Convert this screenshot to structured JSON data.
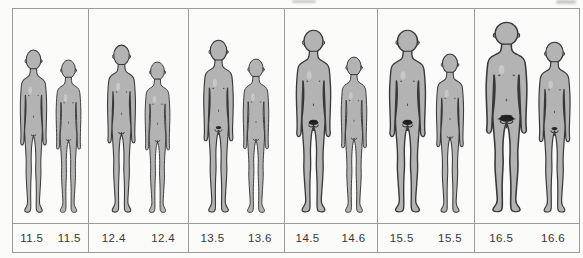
{
  "panels": [
    {
      "ages": [
        "11.5",
        "11.5"
      ],
      "figures": [
        {
          "h": 166,
          "w": 33,
          "pubic": 0
        },
        {
          "h": 156,
          "w": 31,
          "pubic": 0
        }
      ]
    },
    {
      "ages": [
        "12.4",
        "12.4"
      ],
      "figures": [
        {
          "h": 171,
          "w": 35,
          "pubic": 1
        },
        {
          "h": 154,
          "w": 31,
          "pubic": 0
        }
      ]
    },
    {
      "ages": [
        "13.5",
        "13.6"
      ],
      "figures": [
        {
          "h": 176,
          "w": 37,
          "pubic": 2
        },
        {
          "h": 157,
          "w": 32,
          "pubic": 1
        }
      ]
    },
    {
      "ages": [
        "14.5",
        "14.6"
      ],
      "figures": [
        {
          "h": 186,
          "w": 43,
          "pubic": 3
        },
        {
          "h": 159,
          "w": 32,
          "pubic": 1
        }
      ]
    },
    {
      "ages": [
        "15.5",
        "15.5"
      ],
      "figures": [
        {
          "h": 186,
          "w": 45,
          "pubic": 3
        },
        {
          "h": 162,
          "w": 34,
          "pubic": 1
        }
      ]
    },
    {
      "ages": [
        "16.5",
        "16.6"
      ],
      "figures": [
        {
          "h": 194,
          "w": 51,
          "pubic": 4
        },
        {
          "h": 174,
          "w": 39,
          "pubic": 2
        }
      ]
    }
  ],
  "colors": {
    "background": "#fbfbf9",
    "frame_line": "#9c9c9c",
    "body_fill": "#b3b3b3",
    "outline": "#383838",
    "pubic_hair": "#181818",
    "label_text": "#363636"
  }
}
